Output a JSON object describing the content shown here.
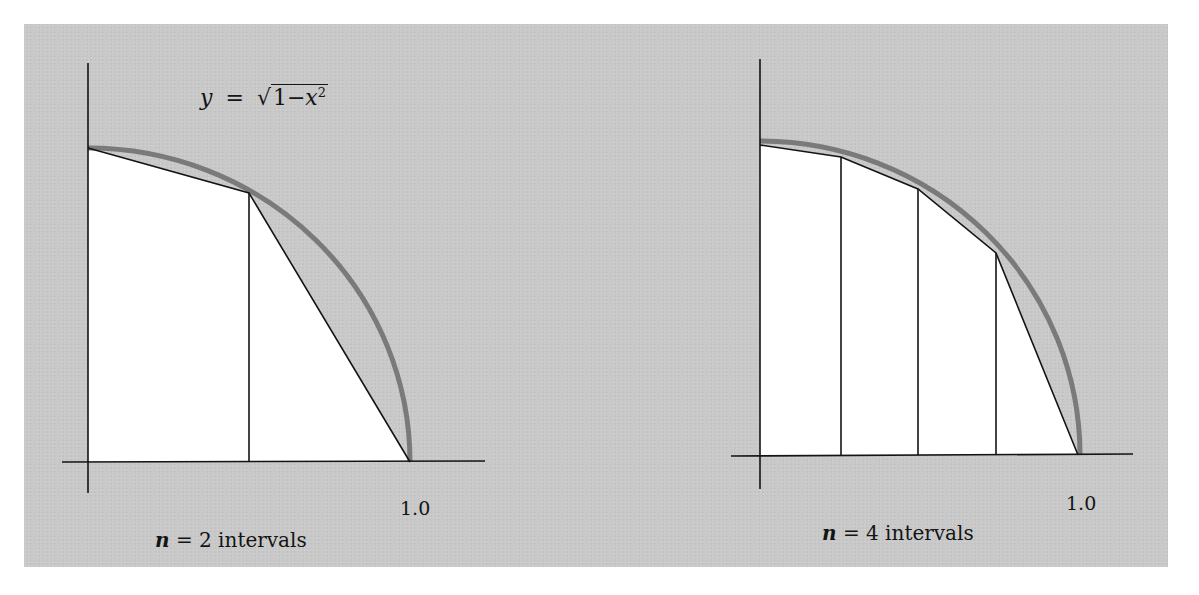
{
  "figure": {
    "background_color": "#c9c9c9",
    "curve_color": "#7a7a7a",
    "line_color": "#141414",
    "fill_color": "#ffffff"
  },
  "left_diagram": {
    "formula": {
      "lhs": "y",
      "equals": "=",
      "sqrt_symbol": "√",
      "radicand_prefix": "1−",
      "radicand_var": "x",
      "exponent": "2"
    },
    "x_tick_label": "1.0",
    "caption": {
      "var": "n",
      "text": " = 2 intervals"
    },
    "n_intervals": 2
  },
  "right_diagram": {
    "x_tick_label": "1.0",
    "caption": {
      "var": "n",
      "text": " = 4 intervals"
    },
    "n_intervals": 4
  }
}
